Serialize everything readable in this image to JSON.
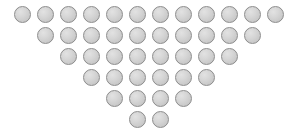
{
  "figure": {
    "background_color": "#ffffff"
  },
  "chart_data": {
    "type": "bar",
    "title": "",
    "subtitle": "",
    "xlabel": "",
    "ylabel": "",
    "grid": false,
    "legend": null,
    "orientation": "rows-descending-inverted-triangle",
    "unit_glyph": "circle",
    "categories": [
      "Row 1",
      "Row 2",
      "Row 3",
      "Row 4",
      "Row 5",
      "Row 6"
    ],
    "values": [
      12,
      10,
      8,
      6,
      4,
      2
    ],
    "total_count": 42,
    "row_indent_units": [
      0,
      1,
      2,
      3,
      4,
      5
    ],
    "geometry": {
      "circle_diameter_px": 17,
      "horizontal_pitch_px": 23,
      "vertical_pitch_px": 21,
      "first_circle_x_px": 14,
      "first_row_y_px": 6
    },
    "colors": {
      "fill": "#d6d6d6",
      "highlight": "#e2e2e2",
      "shadow": "#c2c2c2",
      "stroke": "#8c8c8c",
      "background": "#ffffff"
    }
  },
  "rows": [
    {
      "label": "Row 1",
      "count": 12,
      "indent_units": 0,
      "y_px": 6,
      "x_px": 14
    },
    {
      "label": "Row 2",
      "count": 10,
      "indent_units": 1,
      "y_px": 27,
      "x_px": 37
    },
    {
      "label": "Row 3",
      "count": 8,
      "indent_units": 2,
      "y_px": 48,
      "x_px": 60
    },
    {
      "label": "Row 4",
      "count": 6,
      "indent_units": 3,
      "y_px": 69,
      "x_px": 83
    },
    {
      "label": "Row 5",
      "count": 4,
      "indent_units": 4,
      "y_px": 90,
      "x_px": 106
    },
    {
      "label": "Row 6",
      "count": 2,
      "indent_units": 5,
      "y_px": 111,
      "x_px": 129
    }
  ]
}
